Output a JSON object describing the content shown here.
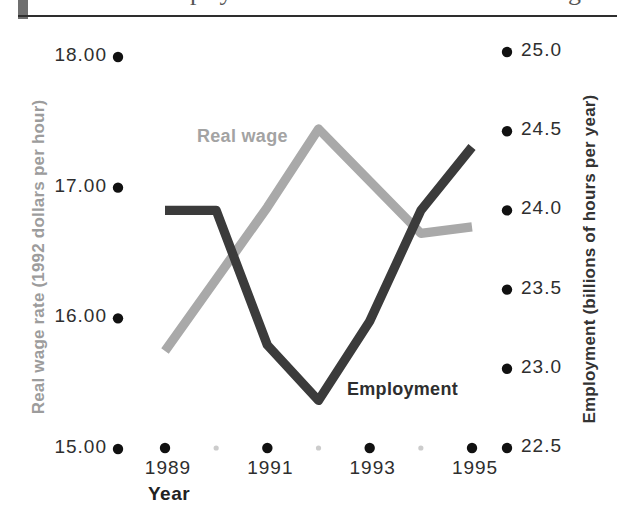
{
  "page": {
    "background": "#ffffff",
    "top_fragment_left": "p y",
    "top_fragment_right": "g"
  },
  "chart_data": {
    "type": "line",
    "title": "",
    "xlabel": "Year",
    "x": [
      1989,
      1990,
      1991,
      1992,
      1993,
      1994,
      1995
    ],
    "x_major_ticks": [
      1989,
      1991,
      1993,
      1995
    ],
    "x_minor_ticks": [
      1990,
      1992,
      1994
    ],
    "left_axis": {
      "label": "Real wage rate (1992 dollars per hour)",
      "ticks": [
        "18.00",
        "17.00",
        "16.00",
        "15.00"
      ],
      "tick_values": [
        18,
        17,
        16,
        15
      ],
      "range": [
        15,
        18
      ],
      "color": "#9c9c9c"
    },
    "right_axis": {
      "label": "Employment (billions of hours per year)",
      "ticks": [
        "25.0",
        "24.5",
        "24.0",
        "23.5",
        "23.0",
        "22.5"
      ],
      "tick_values": [
        25,
        24.5,
        24,
        23.5,
        23,
        22.5
      ],
      "range": [
        22.5,
        25
      ],
      "color": "#333333"
    },
    "series": [
      {
        "name": "Real wage",
        "axis": "left",
        "color": "#a9a9a9",
        "values": [
          15.75,
          16.3,
          16.85,
          17.45,
          17.05,
          16.65,
          16.7
        ]
      },
      {
        "name": "Employment",
        "axis": "right",
        "color": "#3b3b3b",
        "values": [
          24.0,
          24.0,
          23.15,
          22.8,
          23.3,
          24.0,
          24.4
        ]
      }
    ],
    "legend": "inline-labels",
    "grid": false,
    "tick_dot_color": "#111111",
    "minor_tick_dot_color": "#cccccc"
  }
}
